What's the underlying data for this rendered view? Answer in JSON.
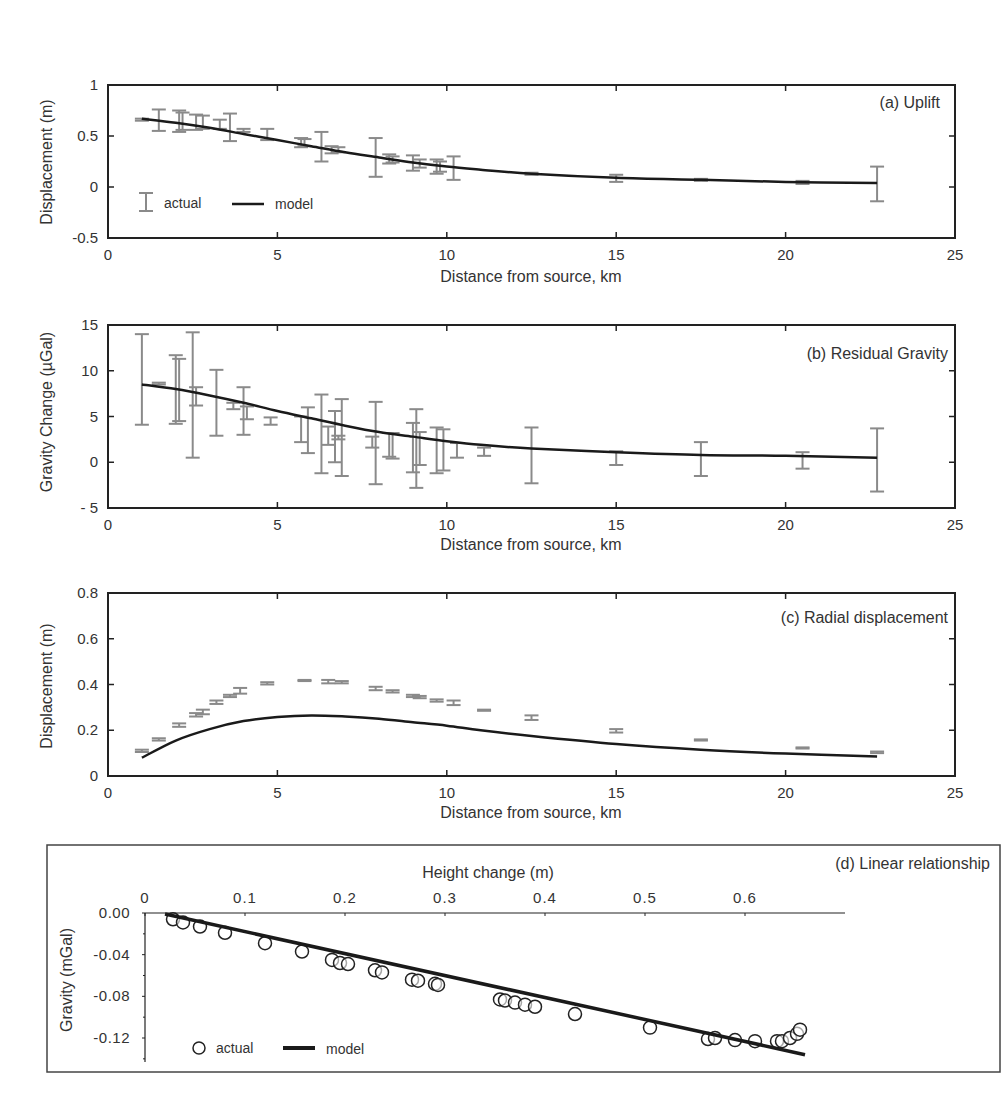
{
  "chart_data": [
    {
      "id": "a",
      "type": "line",
      "title": "(a) Uplift",
      "xlabel": "Distance from source, km",
      "ylabel": "Displacement (m)",
      "xlim": [
        0,
        25
      ],
      "ylim": [
        -0.5,
        1
      ],
      "xticks": [
        "0",
        "5",
        "10",
        "15",
        "20",
        "25"
      ],
      "yticks": [
        "1",
        "0.5",
        "0",
        "-0.5"
      ],
      "legend": [
        "actual",
        "model"
      ],
      "legend_position": "lower left",
      "grid": false,
      "series": [
        {
          "name": "actual",
          "kind": "errorbar",
          "points": [
            {
              "x": 1.0,
              "lo": 0.65,
              "hi": 0.67
            },
            {
              "x": 1.5,
              "lo": 0.55,
              "hi": 0.76
            },
            {
              "x": 2.1,
              "lo": 0.54,
              "hi": 0.75
            },
            {
              "x": 2.2,
              "lo": 0.56,
              "hi": 0.73
            },
            {
              "x": 2.6,
              "lo": 0.56,
              "hi": 0.71
            },
            {
              "x": 2.8,
              "lo": 0.57,
              "hi": 0.7
            },
            {
              "x": 3.3,
              "lo": 0.57,
              "hi": 0.66
            },
            {
              "x": 3.6,
              "lo": 0.45,
              "hi": 0.72
            },
            {
              "x": 4.0,
              "lo": 0.54,
              "hi": 0.57
            },
            {
              "x": 4.7,
              "lo": 0.46,
              "hi": 0.57
            },
            {
              "x": 5.7,
              "lo": 0.39,
              "hi": 0.48
            },
            {
              "x": 5.8,
              "lo": 0.4,
              "hi": 0.47
            },
            {
              "x": 6.3,
              "lo": 0.25,
              "hi": 0.54
            },
            {
              "x": 6.6,
              "lo": 0.33,
              "hi": 0.4
            },
            {
              "x": 6.8,
              "lo": 0.34,
              "hi": 0.39
            },
            {
              "x": 7.9,
              "lo": 0.1,
              "hi": 0.48
            },
            {
              "x": 8.3,
              "lo": 0.23,
              "hi": 0.32
            },
            {
              "x": 8.4,
              "lo": 0.24,
              "hi": 0.3
            },
            {
              "x": 9.0,
              "lo": 0.16,
              "hi": 0.31
            },
            {
              "x": 9.2,
              "lo": 0.19,
              "hi": 0.27
            },
            {
              "x": 9.7,
              "lo": 0.13,
              "hi": 0.27
            },
            {
              "x": 9.8,
              "lo": 0.15,
              "hi": 0.25
            },
            {
              "x": 10.2,
              "lo": 0.07,
              "hi": 0.3
            },
            {
              "x": 12.5,
              "lo": 0.12,
              "hi": 0.14
            },
            {
              "x": 15.0,
              "lo": 0.05,
              "hi": 0.12
            },
            {
              "x": 17.5,
              "lo": 0.06,
              "hi": 0.08
            },
            {
              "x": 20.5,
              "lo": 0.03,
              "hi": 0.06
            },
            {
              "x": 22.7,
              "lo": -0.14,
              "hi": 0.2
            }
          ]
        },
        {
          "name": "model",
          "kind": "line",
          "x": [
            1.0,
            2.0,
            3.0,
            4.0,
            5.0,
            6.0,
            7.0,
            8.0,
            9.0,
            10.0,
            11.0,
            12.5,
            15.0,
            17.5,
            20.0,
            22.7
          ],
          "y": [
            0.67,
            0.63,
            0.58,
            0.52,
            0.46,
            0.4,
            0.34,
            0.29,
            0.24,
            0.2,
            0.17,
            0.13,
            0.09,
            0.07,
            0.05,
            0.04
          ]
        }
      ]
    },
    {
      "id": "b",
      "type": "line",
      "title": "(b) Residual Gravity",
      "xlabel": "Distance from source, km",
      "ylabel": "Gravity Change (µGal)",
      "xlim": [
        0,
        25
      ],
      "ylim": [
        -5,
        15
      ],
      "xticks": [
        "0",
        "5",
        "10",
        "15",
        "20",
        "25"
      ],
      "yticks": [
        "15",
        "10",
        "5",
        "0",
        "- 5"
      ],
      "grid": false,
      "series": [
        {
          "name": "actual",
          "kind": "errorbar",
          "points": [
            {
              "x": 1.0,
              "lo": 4.1,
              "hi": 14.0
            },
            {
              "x": 1.5,
              "lo": 8.5,
              "hi": 8.7
            },
            {
              "x": 2.0,
              "lo": 4.2,
              "hi": 11.7
            },
            {
              "x": 2.1,
              "lo": 4.5,
              "hi": 11.3
            },
            {
              "x": 2.5,
              "lo": 0.5,
              "hi": 14.2
            },
            {
              "x": 2.6,
              "lo": 6.2,
              "hi": 8.2
            },
            {
              "x": 3.2,
              "lo": 2.9,
              "hi": 10.1
            },
            {
              "x": 3.7,
              "lo": 5.8,
              "hi": 6.5
            },
            {
              "x": 4.0,
              "lo": 3.0,
              "hi": 8.2
            },
            {
              "x": 4.1,
              "lo": 4.7,
              "hi": 6.1
            },
            {
              "x": 4.8,
              "lo": 4.1,
              "hi": 4.9
            },
            {
              "x": 5.7,
              "lo": 2.2,
              "hi": 5.0
            },
            {
              "x": 5.9,
              "lo": 1.0,
              "hi": 6.0
            },
            {
              "x": 6.3,
              "lo": -1.2,
              "hi": 7.4
            },
            {
              "x": 6.5,
              "lo": 1.9,
              "hi": 3.9
            },
            {
              "x": 6.7,
              "lo": 0.0,
              "hi": 5.6
            },
            {
              "x": 6.9,
              "lo": -1.5,
              "hi": 6.9
            },
            {
              "x": 6.8,
              "lo": 2.5,
              "hi": 2.9
            },
            {
              "x": 7.9,
              "lo": -2.4,
              "hi": 6.6
            },
            {
              "x": 7.8,
              "lo": 1.6,
              "hi": 2.8
            },
            {
              "x": 8.3,
              "lo": 0.6,
              "hi": 3.2
            },
            {
              "x": 8.4,
              "lo": 0.4,
              "hi": 3.2
            },
            {
              "x": 9.0,
              "lo": -1.1,
              "hi": 4.3
            },
            {
              "x": 9.1,
              "lo": -2.8,
              "hi": 5.8
            },
            {
              "x": 9.2,
              "lo": -0.3,
              "hi": 3.3
            },
            {
              "x": 9.7,
              "lo": -1.2,
              "hi": 3.8
            },
            {
              "x": 9.9,
              "lo": -0.9,
              "hi": 3.6
            },
            {
              "x": 10.3,
              "lo": 0.5,
              "hi": 2.1
            },
            {
              "x": 11.1,
              "lo": 0.7,
              "hi": 1.6
            },
            {
              "x": 12.5,
              "lo": -2.3,
              "hi": 3.8
            },
            {
              "x": 15.0,
              "lo": -0.3,
              "hi": 1.2
            },
            {
              "x": 17.5,
              "lo": -1.5,
              "hi": 2.2
            },
            {
              "x": 20.5,
              "lo": -0.7,
              "hi": 1.1
            },
            {
              "x": 22.7,
              "lo": -3.2,
              "hi": 3.7
            }
          ]
        },
        {
          "name": "model",
          "kind": "line",
          "x": [
            1.0,
            2.0,
            3.0,
            4.0,
            5.0,
            6.0,
            7.0,
            8.0,
            9.0,
            10.0,
            11.0,
            12.5,
            15.0,
            17.5,
            20.0,
            22.7
          ],
          "y": [
            8.5,
            8.0,
            7.3,
            6.5,
            5.6,
            4.8,
            4.0,
            3.3,
            2.8,
            2.3,
            1.9,
            1.5,
            1.1,
            0.8,
            0.7,
            0.5
          ]
        }
      ]
    },
    {
      "id": "c",
      "type": "line",
      "title": "(c) Radial displacement",
      "xlabel": "Distance from source, km",
      "ylabel": "Displacement (m)",
      "xlim": [
        0,
        25
      ],
      "ylim": [
        0,
        0.8
      ],
      "xticks": [
        "0",
        "5",
        "10",
        "15",
        "20",
        "25"
      ],
      "yticks": [
        "0.8",
        "0.6",
        "0.4",
        "0.2",
        "0"
      ],
      "grid": false,
      "series": [
        {
          "name": "actual",
          "kind": "errorbar",
          "points": [
            {
              "x": 1.0,
              "lo": 0.105,
              "hi": 0.115
            },
            {
              "x": 1.5,
              "lo": 0.155,
              "hi": 0.165
            },
            {
              "x": 2.1,
              "lo": 0.215,
              "hi": 0.23
            },
            {
              "x": 2.6,
              "lo": 0.26,
              "hi": 0.275
            },
            {
              "x": 2.8,
              "lo": 0.27,
              "hi": 0.29
            },
            {
              "x": 3.2,
              "lo": 0.315,
              "hi": 0.33
            },
            {
              "x": 3.6,
              "lo": 0.345,
              "hi": 0.355
            },
            {
              "x": 3.9,
              "lo": 0.36,
              "hi": 0.385
            },
            {
              "x": 4.7,
              "lo": 0.4,
              "hi": 0.41
            },
            {
              "x": 5.8,
              "lo": 0.415,
              "hi": 0.42
            },
            {
              "x": 6.5,
              "lo": 0.405,
              "hi": 0.42
            },
            {
              "x": 6.9,
              "lo": 0.405,
              "hi": 0.415
            },
            {
              "x": 7.9,
              "lo": 0.375,
              "hi": 0.39
            },
            {
              "x": 8.4,
              "lo": 0.365,
              "hi": 0.375
            },
            {
              "x": 9.0,
              "lo": 0.345,
              "hi": 0.355
            },
            {
              "x": 9.2,
              "lo": 0.34,
              "hi": 0.35
            },
            {
              "x": 9.7,
              "lo": 0.325,
              "hi": 0.335
            },
            {
              "x": 10.2,
              "lo": 0.31,
              "hi": 0.33
            },
            {
              "x": 11.1,
              "lo": 0.285,
              "hi": 0.29
            },
            {
              "x": 12.5,
              "lo": 0.245,
              "hi": 0.265
            },
            {
              "x": 15.0,
              "lo": 0.19,
              "hi": 0.205
            },
            {
              "x": 17.5,
              "lo": 0.155,
              "hi": 0.16
            },
            {
              "x": 20.5,
              "lo": 0.12,
              "hi": 0.125
            },
            {
              "x": 22.7,
              "lo": 0.1,
              "hi": 0.107
            }
          ]
        },
        {
          "name": "model",
          "kind": "line",
          "x": [
            1.0,
            2.0,
            3.0,
            4.0,
            5.0,
            6.0,
            7.0,
            8.0,
            9.0,
            10.0,
            11.0,
            12.5,
            15.0,
            17.5,
            20.0,
            22.7
          ],
          "y": [
            0.08,
            0.155,
            0.205,
            0.24,
            0.258,
            0.265,
            0.26,
            0.25,
            0.235,
            0.22,
            0.2,
            0.175,
            0.14,
            0.115,
            0.098,
            0.085
          ]
        }
      ]
    },
    {
      "id": "d",
      "type": "scatter",
      "title": "(d) Linear relationship",
      "xlabel": "Height change (m)",
      "ylabel": "Gravity (mGal)",
      "xaxis_position": "top",
      "xlim": [
        0,
        0.7
      ],
      "ylim": [
        -0.14,
        0.0
      ],
      "xticks": [
        "0",
        "0.1",
        "0.2",
        "0.3",
        "0.4",
        "0.5",
        "0.6"
      ],
      "yticks": [
        "0.00",
        "-0.04",
        "-0.08",
        "-0.12"
      ],
      "legend": [
        "actual",
        "model"
      ],
      "legend_position": "lower left",
      "grid": false,
      "series": [
        {
          "name": "actual",
          "kind": "scatter",
          "marker": "open-circle",
          "x": [
            0.028,
            0.038,
            0.055,
            0.08,
            0.12,
            0.157,
            0.187,
            0.195,
            0.203,
            0.23,
            0.237,
            0.267,
            0.273,
            0.29,
            0.293,
            0.355,
            0.36,
            0.37,
            0.38,
            0.39,
            0.43,
            0.505,
            0.563,
            0.57,
            0.59,
            0.61,
            0.632,
            0.637,
            0.645,
            0.652,
            0.655
          ],
          "y": [
            -0.006,
            -0.009,
            -0.013,
            -0.019,
            -0.029,
            -0.037,
            -0.045,
            -0.048,
            -0.049,
            -0.055,
            -0.057,
            -0.064,
            -0.065,
            -0.068,
            -0.069,
            -0.083,
            -0.084,
            -0.086,
            -0.088,
            -0.09,
            -0.097,
            -0.11,
            -0.121,
            -0.12,
            -0.122,
            -0.123,
            -0.123,
            -0.123,
            -0.12,
            -0.116,
            -0.112
          ]
        },
        {
          "name": "model",
          "kind": "line",
          "x": [
            0.02,
            0.66
          ],
          "y": [
            -0.001,
            -0.136
          ]
        }
      ]
    }
  ],
  "panels": {
    "a": {
      "title": "(a) Uplift",
      "xlabel": "Distance from source, km",
      "ylabel": "Displacement (m)",
      "legend_actual": "actual",
      "legend_model": "model"
    },
    "b": {
      "title": "(b) Residual Gravity",
      "xlabel": "Distance from source, km",
      "ylabel": "Gravity Change (µGal)"
    },
    "c": {
      "title": "(c) Radial displacement",
      "xlabel": "Distance from source, km",
      "ylabel": "Displacement (m)"
    },
    "d": {
      "title": "(d) Linear relationship",
      "xlabel": "Height change (m)",
      "ylabel": "Gravity (mGal)",
      "legend_actual": "actual",
      "legend_model": "model"
    }
  },
  "colors": {
    "axis": "#222222",
    "actual": "#8a8a8a",
    "model": "#1a1a1a",
    "text": "#333333"
  }
}
